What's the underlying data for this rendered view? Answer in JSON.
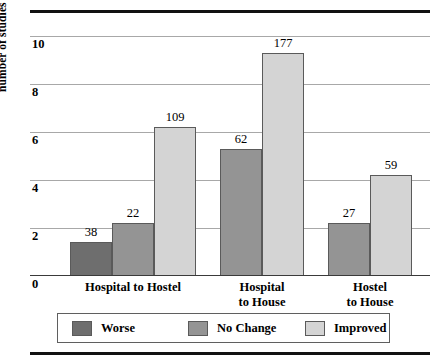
{
  "chart_data": {
    "type": "bar",
    "title": "",
    "xlabel": "",
    "ylabel": "number of studies",
    "ylim": [
      0,
      10.6
    ],
    "yticks": [
      0,
      2,
      4,
      6,
      8,
      10
    ],
    "ytick_labels": [
      "0",
      "2",
      "4",
      "6",
      "8",
      "10"
    ],
    "grid": true,
    "legend_position": "bottom",
    "categories": [
      "Hospital to Hostel",
      "Hospital\nto House",
      "Hostel\nto House"
    ],
    "series": [
      {
        "name": "Worse",
        "color": "#6e6e6e",
        "values": [
          1.4,
          null,
          null
        ],
        "labels": [
          "38",
          "",
          ""
        ]
      },
      {
        "name": "No Change",
        "color": "#949494",
        "values": [
          2.2,
          5.3,
          2.2
        ],
        "labels": [
          "22",
          "62",
          "27"
        ]
      },
      {
        "name": "Improved",
        "color": "#d4d4d4",
        "values": [
          6.2,
          9.3,
          4.2
        ],
        "labels": [
          "109",
          "177",
          "59"
        ]
      }
    ],
    "bars": [
      {
        "group": "Hospital to Hostel",
        "series": "Worse",
        "label": "38",
        "value": 1.4,
        "color": "#6e6e6e",
        "x": 40,
        "w": 42
      },
      {
        "group": "Hospital to Hostel",
        "series": "No Change",
        "label": "22",
        "value": 2.2,
        "color": "#949494",
        "x": 82,
        "w": 42
      },
      {
        "group": "Hospital to Hostel",
        "series": "Improved",
        "label": "109",
        "value": 6.2,
        "color": "#d4d4d4",
        "x": 124,
        "w": 42
      },
      {
        "group": "Hospital to House",
        "series": "No Change",
        "label": "62",
        "value": 5.3,
        "color": "#949494",
        "x": 190,
        "w": 42
      },
      {
        "group": "Hospital to House",
        "series": "Improved",
        "label": "177",
        "value": 9.3,
        "color": "#d4d4d4",
        "x": 232,
        "w": 42
      },
      {
        "group": "Hostel to House",
        "series": "No Change",
        "label": "27",
        "value": 2.2,
        "color": "#949494",
        "x": 298,
        "w": 42
      },
      {
        "group": "Hostel to House",
        "series": "Improved",
        "label": "59",
        "value": 4.2,
        "color": "#d4d4d4",
        "x": 340,
        "w": 42
      }
    ]
  },
  "axis": {
    "y_title": "number of studies",
    "ticks": [
      "10",
      "8",
      "6",
      "4",
      "2",
      "0"
    ]
  },
  "categories": [
    {
      "text": "Hospital to Hostel",
      "center": 103
    },
    {
      "text": "Hospital\nto House",
      "center": 232
    },
    {
      "text": "Hostel\nto House",
      "center": 340
    }
  ],
  "legend": {
    "items": [
      {
        "label": "Worse",
        "color": "#6e6e6e",
        "x": 14
      },
      {
        "label": "No Change",
        "color": "#949494",
        "x": 130
      },
      {
        "label": "Improved",
        "color": "#d4d4d4",
        "x": 247
      }
    ]
  },
  "colors": {
    "worse": "#6e6e6e",
    "no_change": "#949494",
    "improved": "#d4d4d4",
    "gridline": "#a8a8a8",
    "rule": "#111111",
    "text": "#000000"
  }
}
